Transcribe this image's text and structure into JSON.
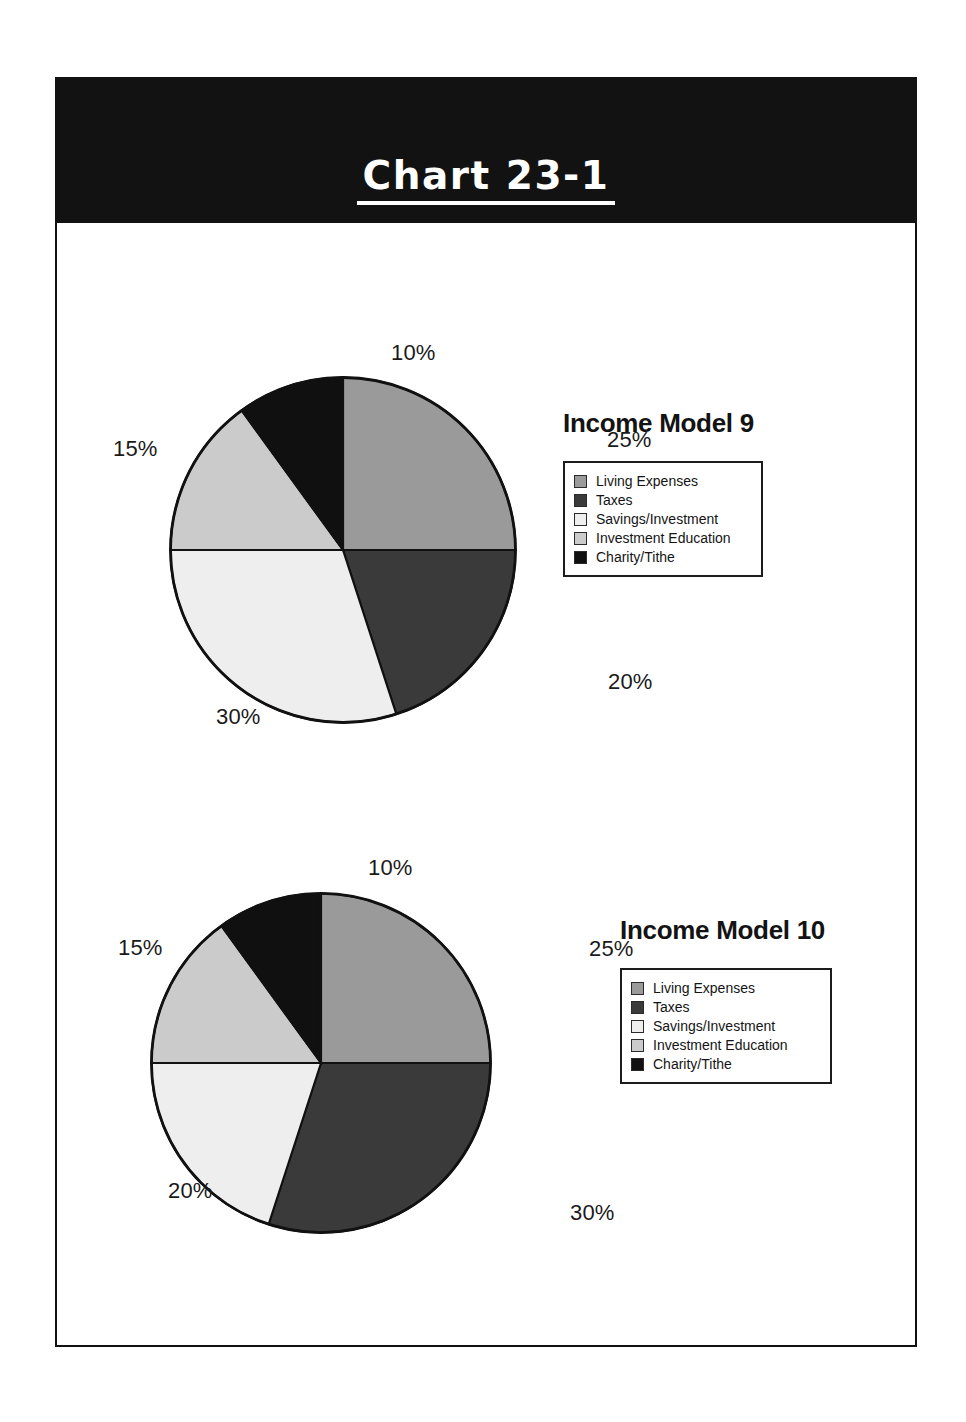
{
  "banner": {
    "title": "Chart 23-1"
  },
  "palette": {
    "living_expenses": "#9a9a9a",
    "taxes": "#3a3a3a",
    "savings_investment": "#eeeeee",
    "investment_education": "#cbcbcb",
    "charity_tithe": "#101010",
    "outline": "#111111",
    "banner_background": "#121212",
    "banner_text": "#ffffff",
    "page_background": "#ffffff"
  },
  "legend_labels": {
    "living_expenses": "Living Expenses",
    "taxes": "Taxes",
    "savings_investment": "Savings/Investment",
    "investment_education": "Investment Education",
    "charity_tithe": "Charity/Tithe"
  },
  "charts": [
    {
      "title": "Income Model 9",
      "labels": {
        "living_expenses": "25%",
        "taxes": "20%",
        "savings_investment": "30%",
        "investment_education": "15%",
        "charity_tithe": "10%"
      }
    },
    {
      "title": "Income Model 10",
      "labels": {
        "living_expenses": "25%",
        "taxes": "30%",
        "savings_investment": "20%",
        "investment_education": "15%",
        "charity_tithe": "10%"
      }
    }
  ],
  "chart_data": [
    {
      "type": "pie",
      "title": "Income Model 9",
      "categories": [
        "Living Expenses",
        "Taxes",
        "Savings/Investment",
        "Investment Education",
        "Charity/Tithe"
      ],
      "values": [
        25,
        20,
        30,
        15,
        10
      ],
      "value_labels": [
        "25%",
        "20%",
        "30%",
        "15%",
        "10%"
      ],
      "unit": "percent",
      "start_angle_deg": 0,
      "direction": "clockwise",
      "colors": [
        "#9a9a9a",
        "#3a3a3a",
        "#eeeeee",
        "#cbcbcb",
        "#101010"
      ],
      "legend_position": "right",
      "labels_outside": true,
      "grid": false
    },
    {
      "type": "pie",
      "title": "Income Model 10",
      "categories": [
        "Living Expenses",
        "Taxes",
        "Savings/Investment",
        "Investment Education",
        "Charity/Tithe"
      ],
      "values": [
        25,
        30,
        20,
        15,
        10
      ],
      "value_labels": [
        "25%",
        "30%",
        "20%",
        "15%",
        "10%"
      ],
      "unit": "percent",
      "start_angle_deg": 0,
      "direction": "clockwise",
      "colors": [
        "#9a9a9a",
        "#3a3a3a",
        "#eeeeee",
        "#cbcbcb",
        "#101010"
      ],
      "legend_position": "right",
      "labels_outside": true,
      "grid": false
    }
  ]
}
